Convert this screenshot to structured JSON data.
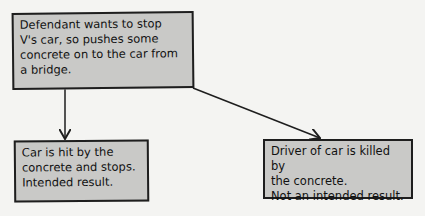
{
  "diagram": {
    "type": "flowchart",
    "nodes": [
      {
        "id": "cause",
        "text": "Defendant wants to stop\nV's car, so pushes some\nconcrete on to the car from\na bridge."
      },
      {
        "id": "result-left",
        "text": "Car is hit by the\nconcrete and stops.\nIntended result."
      },
      {
        "id": "result-right",
        "text": "Driver of car is killed by\nthe concrete.\nNot an intended result."
      }
    ],
    "edges": [
      {
        "from": "cause",
        "to": "result-left"
      },
      {
        "from": "cause",
        "to": "result-right"
      }
    ]
  },
  "colors": {
    "box_fill": "#c9c9c7",
    "border": "#1e1e1e",
    "background": "#f4f4f2"
  }
}
